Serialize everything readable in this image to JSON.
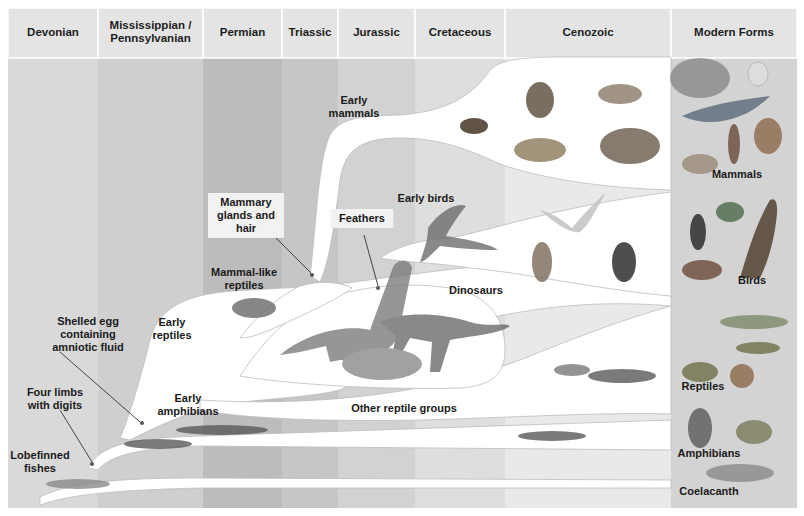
{
  "periods": [
    {
      "label_lines": [
        "Devonian"
      ],
      "x": 8,
      "w": 90,
      "color": "#d9d9d9",
      "header": "#e4e4e4"
    },
    {
      "label_lines": [
        "Mississippian /",
        "Pennsylvanian"
      ],
      "x": 98,
      "w": 105,
      "color": "#cfcfcf",
      "header": "#e4e4e4"
    },
    {
      "label_lines": [
        "Permian"
      ],
      "x": 203,
      "w": 79,
      "color": "#bcbcbc",
      "header": "#e4e4e4"
    },
    {
      "label_lines": [
        "Triassic"
      ],
      "x": 282,
      "w": 56,
      "color": "#c6c6c6",
      "header": "#e4e4e4"
    },
    {
      "label_lines": [
        "Jurassic"
      ],
      "x": 338,
      "w": 77,
      "color": "#d2d2d2",
      "header": "#e4e4e4"
    },
    {
      "label_lines": [
        "Cretaceous"
      ],
      "x": 415,
      "w": 90,
      "color": "#dedede",
      "header": "#e4e4e4"
    },
    {
      "label_lines": [
        "Cenozoic"
      ],
      "x": 505,
      "w": 166,
      "color": "#e9e9e9",
      "header": "#e4e4e4"
    },
    {
      "label_lines": [
        "Modern Forms"
      ],
      "x": 671,
      "w": 126,
      "color": "#d3d3d3",
      "header": "#e4e4e4"
    }
  ],
  "branch_labels": [
    {
      "id": "early-mammals",
      "lines": [
        "Early",
        "mammals"
      ],
      "x": 354,
      "y": 104
    },
    {
      "id": "mammary-glands-and-hair",
      "lines": [
        "Mammary",
        "glands and",
        "hair"
      ],
      "x": 246,
      "y": 206,
      "boxed": true
    },
    {
      "id": "feathers",
      "lines": [
        "Feathers"
      ],
      "x": 362,
      "y": 222,
      "boxed": true
    },
    {
      "id": "early-birds",
      "lines": [
        "Early birds"
      ],
      "x": 426,
      "y": 202
    },
    {
      "id": "mammal-like-reptiles",
      "lines": [
        "Mammal-like",
        "reptiles"
      ],
      "x": 244,
      "y": 276
    },
    {
      "id": "dinosaurs",
      "lines": [
        "Dinosaurs"
      ],
      "x": 476,
      "y": 294
    },
    {
      "id": "early-reptiles",
      "lines": [
        "Early",
        "reptiles"
      ],
      "x": 172,
      "y": 326
    },
    {
      "id": "shelled-egg",
      "lines": [
        "Shelled egg",
        "containing",
        "amniotic fluid"
      ],
      "x": 88,
      "y": 325
    },
    {
      "id": "four-limbs-with-digits",
      "lines": [
        "Four limbs",
        "with digits"
      ],
      "x": 55,
      "y": 396
    },
    {
      "id": "early-amphibians",
      "lines": [
        "Early",
        "amphibians"
      ],
      "x": 188,
      "y": 402
    },
    {
      "id": "other-reptile-groups",
      "lines": [
        "Other reptile groups"
      ],
      "x": 404,
      "y": 412
    },
    {
      "id": "lobefinned-fishes",
      "lines": [
        "Lobefinned",
        "fishes"
      ],
      "x": 40,
      "y": 459
    }
  ],
  "modern_forms": [
    {
      "label": "Mammals",
      "x": 737,
      "y": 178
    },
    {
      "label": "Birds",
      "x": 752,
      "y": 284
    },
    {
      "label": "Reptiles",
      "x": 703,
      "y": 390
    },
    {
      "label": "Amphibians",
      "x": 709,
      "y": 457
    },
    {
      "label": "Coelacanth",
      "x": 709,
      "y": 495
    }
  ],
  "organisms": {
    "cenozoic_mammals": [
      "monkey",
      "bear",
      "tapir",
      "mammoth"
    ],
    "early_mammal": "shrew",
    "modern_mammals": [
      "elephant",
      "rabbit",
      "whale",
      "deer",
      "human",
      "wolf"
    ],
    "early_bird": "archaeopteryx",
    "cenozoic_birds": [
      "gull",
      "owl",
      "puffin"
    ],
    "modern_birds": [
      "penguin",
      "parrots",
      "pheasant",
      "eagle"
    ],
    "dinosaurs": [
      "brachiosaurus",
      "allosaurus",
      "triceratops"
    ],
    "mammal_like_reptile": "cynodont",
    "other_reptiles": [
      "lizard",
      "salamander"
    ],
    "modern_reptiles": [
      "crocodile",
      "lizard",
      "turtle",
      "snake"
    ],
    "early_amphibians": [
      "eryops",
      "ichthyostega"
    ],
    "cenozoic_amphibian": "salamander",
    "modern_amphibians": [
      "salamander",
      "frog"
    ],
    "fishes": [
      "lobefinned-fish",
      "coelacanth"
    ]
  }
}
